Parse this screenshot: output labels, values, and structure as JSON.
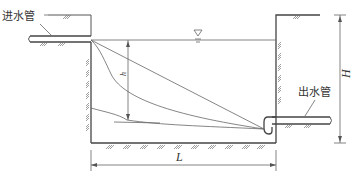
{
  "diagram": {
    "type": "cross-section",
    "labels": {
      "inlet_pipe": "进水管",
      "outlet_pipe": "出水管",
      "height_total": "H",
      "water_depth": "h",
      "length": "L",
      "water_level_symbol": "▽"
    },
    "colors": {
      "line": "#555555",
      "text": "#333333",
      "background": "#ffffff"
    }
  }
}
